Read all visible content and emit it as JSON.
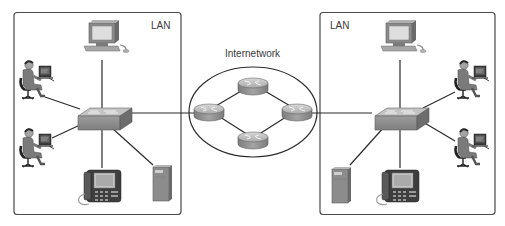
{
  "diagram": {
    "type": "network-topology",
    "colors": {
      "line": "#2b2b2b",
      "box_border": "#4a4a4a",
      "device_gray": "#9a9a9a",
      "device_dark": "#6e6e6e",
      "device_light": "#c8c8c8",
      "screen": "#dcdcdc",
      "background": "#ffffff"
    },
    "groups": [
      {
        "id": "lan-left",
        "label": "LAN"
      },
      {
        "id": "internetwork",
        "label": "Internetwork"
      },
      {
        "id": "lan-right",
        "label": "LAN"
      }
    ],
    "nodes": [
      {
        "id": "L-pc",
        "type": "desktop-pc",
        "group": "lan-left"
      },
      {
        "id": "L-user1",
        "type": "user-workstation",
        "group": "lan-left"
      },
      {
        "id": "L-user2",
        "type": "user-workstation",
        "group": "lan-left"
      },
      {
        "id": "L-switch",
        "type": "switch",
        "group": "lan-left"
      },
      {
        "id": "L-phone",
        "type": "ip-phone",
        "group": "lan-left"
      },
      {
        "id": "L-server",
        "type": "server",
        "group": "lan-left"
      },
      {
        "id": "R1",
        "type": "router",
        "group": "internetwork",
        "position": "left"
      },
      {
        "id": "R2",
        "type": "router",
        "group": "internetwork",
        "position": "top"
      },
      {
        "id": "R3",
        "type": "router",
        "group": "internetwork",
        "position": "right"
      },
      {
        "id": "R4",
        "type": "router",
        "group": "internetwork",
        "position": "bottom"
      },
      {
        "id": "R-pc",
        "type": "desktop-pc",
        "group": "lan-right"
      },
      {
        "id": "R-user1",
        "type": "user-workstation",
        "group": "lan-right"
      },
      {
        "id": "R-user2",
        "type": "user-workstation",
        "group": "lan-right"
      },
      {
        "id": "R-switch",
        "type": "switch",
        "group": "lan-right"
      },
      {
        "id": "R-phone",
        "type": "ip-phone",
        "group": "lan-right"
      },
      {
        "id": "R-server",
        "type": "server",
        "group": "lan-right"
      }
    ],
    "edges": [
      [
        "L-pc",
        "L-switch"
      ],
      [
        "L-user1",
        "L-switch"
      ],
      [
        "L-user2",
        "L-switch"
      ],
      [
        "L-phone",
        "L-switch"
      ],
      [
        "L-server",
        "L-switch"
      ],
      [
        "L-switch",
        "R1"
      ],
      [
        "R1",
        "R2"
      ],
      [
        "R2",
        "R3"
      ],
      [
        "R3",
        "R4"
      ],
      [
        "R4",
        "R1"
      ],
      [
        "R3",
        "R-switch"
      ],
      [
        "R-pc",
        "R-switch"
      ],
      [
        "R-user1",
        "R-switch"
      ],
      [
        "R-user2",
        "R-switch"
      ],
      [
        "R-phone",
        "R-switch"
      ],
      [
        "R-server",
        "R-switch"
      ]
    ]
  }
}
